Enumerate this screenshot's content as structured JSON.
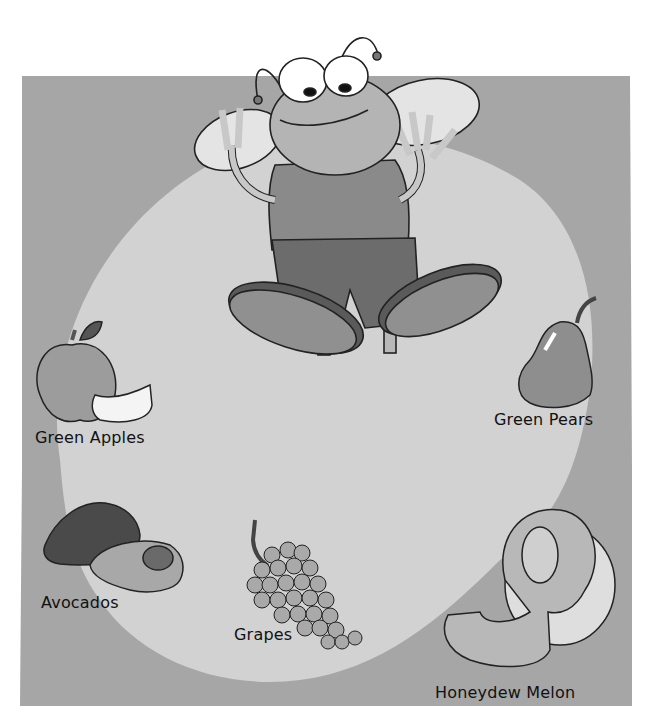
{
  "scene": {
    "title": "Green foods illustration",
    "character": "cartoon-fly",
    "colors": {
      "background": "#ffffff",
      "panel": "#a6a6a6",
      "spotlight": "#d2d2d2",
      "outline": "#222222"
    }
  },
  "fruits": [
    {
      "id": "green-apples",
      "label": "Green Apples"
    },
    {
      "id": "green-pears",
      "label": "Green Pears"
    },
    {
      "id": "avocados",
      "label": "Avocados"
    },
    {
      "id": "grapes",
      "label": "Grapes"
    },
    {
      "id": "honeydew-melon",
      "label": "Honeydew Melon"
    }
  ]
}
